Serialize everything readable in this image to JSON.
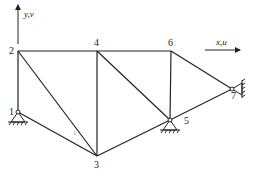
{
  "diagram": {
    "type": "plane-truss",
    "axes": {
      "y_label": "y,v",
      "x_label": "x,u"
    },
    "nodes": [
      {
        "id": "1",
        "label": "1",
        "x": 18,
        "y": 112,
        "support": "pin"
      },
      {
        "id": "2",
        "label": "2",
        "x": 18,
        "y": 51
      },
      {
        "id": "3",
        "label": "3",
        "x": 97,
        "y": 156
      },
      {
        "id": "4",
        "label": "4",
        "x": 97,
        "y": 51
      },
      {
        "id": "5",
        "label": "5",
        "x": 170,
        "y": 120,
        "support": "pin"
      },
      {
        "id": "6",
        "label": "6",
        "x": 171,
        "y": 51
      },
      {
        "id": "7",
        "label": "7",
        "x": 232,
        "y": 89,
        "support": "pin-wall"
      }
    ],
    "members": [
      [
        "1",
        "2"
      ],
      [
        "2",
        "4"
      ],
      [
        "4",
        "6"
      ],
      [
        "1",
        "3"
      ],
      [
        "2",
        "3"
      ],
      [
        "3",
        "4"
      ],
      [
        "3",
        "5"
      ],
      [
        "4",
        "5"
      ],
      [
        "5",
        "6"
      ],
      [
        "5",
        "7"
      ],
      [
        "6",
        "7"
      ]
    ],
    "element_label": "1"
  }
}
